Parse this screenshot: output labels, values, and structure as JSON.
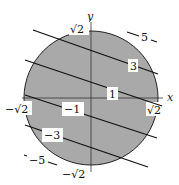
{
  "figure": {
    "colors": {
      "disk_fill": "#a9a9a9",
      "disk_edge": "#222222",
      "line": "#111111",
      "background": "#ffffff",
      "label_box": "#ffffff"
    },
    "axes": {
      "x_label": "x",
      "y_label": "y"
    },
    "tick_labels": {
      "top": "√2",
      "bottom": "−√2",
      "left": "−√2",
      "right": "√2"
    },
    "level_lines": [
      {
        "value": "5",
        "label": "5",
        "outside_disk": true
      },
      {
        "value": "3",
        "label": "3",
        "outside_disk": false
      },
      {
        "value": "1",
        "label": "1",
        "outside_disk": false
      },
      {
        "value": "-1",
        "label": "−1",
        "outside_disk": false
      },
      {
        "value": "-3",
        "label": "−3",
        "outside_disk": false
      },
      {
        "value": "-5",
        "label": "−5",
        "outside_disk": true
      }
    ]
  }
}
